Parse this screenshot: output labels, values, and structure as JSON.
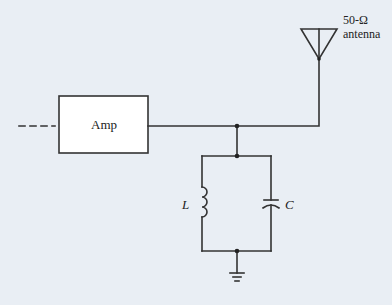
{
  "diagram": {
    "type": "circuit-schematic",
    "components": {
      "amplifier": {
        "label": "Amp"
      },
      "antenna": {
        "label_line1": "50-Ω",
        "label_line2": "antenna"
      },
      "inductor": {
        "label": "L"
      },
      "capacitor": {
        "label": "C"
      },
      "ground": {
        "label": ""
      }
    },
    "colors": {
      "background": "#e9eef4",
      "wire": "#333333",
      "amp_fill": "#ffffff"
    }
  }
}
